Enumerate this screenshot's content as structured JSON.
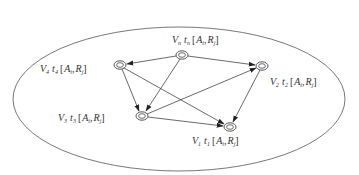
{
  "diagram": {
    "type": "directed-graph",
    "boundary": "ellipse",
    "nodes": [
      {
        "id": "Vn",
        "x": 182,
        "y": 55,
        "label": {
          "v": "V",
          "vsub": "n",
          "t": "t",
          "tsub": "n",
          "a": "A",
          "asub": "i",
          "r": "R",
          "rsub": "j"
        }
      },
      {
        "id": "V4",
        "x": 120,
        "y": 65,
        "label": {
          "v": "V",
          "vsub": "4",
          "t": "t",
          "tsub": "4",
          "a": "A",
          "asub": "i",
          "r": "R",
          "rsub": "j"
        }
      },
      {
        "id": "V2",
        "x": 262,
        "y": 66,
        "label": {
          "v": "V",
          "vsub": "2",
          "t": "t",
          "tsub": "2",
          "a": "A",
          "asub": "i",
          "r": "R",
          "rsub": "j"
        }
      },
      {
        "id": "V3",
        "x": 142,
        "y": 116,
        "label": {
          "v": "V",
          "vsub": "3",
          "t": "t",
          "tsub": "3",
          "a": "A",
          "asub": "i",
          "r": "R",
          "rsub": "j"
        }
      },
      {
        "id": "V1",
        "x": 230,
        "y": 127,
        "label": {
          "v": "V",
          "vsub": "1",
          "t": "t",
          "tsub": "1",
          "a": "A",
          "asub": "i",
          "r": "R",
          "rsub": "j"
        }
      }
    ],
    "edges": [
      {
        "from": "Vn",
        "to": "V4"
      },
      {
        "from": "Vn",
        "to": "V2"
      },
      {
        "from": "Vn",
        "to": "V3"
      },
      {
        "from": "V4",
        "to": "V3"
      },
      {
        "from": "V4",
        "to": "V1"
      },
      {
        "from": "V3",
        "to": "V2"
      },
      {
        "from": "V3",
        "to": "V1"
      },
      {
        "from": "V2",
        "to": "V1"
      }
    ]
  },
  "labels": {
    "vn": {
      "v": "V",
      "vsub": "n",
      "t": "t",
      "tsub": "n",
      "open": "[",
      "a": "A",
      "asub": "i",
      "sep": ",",
      "r": "R",
      "rsub": "j",
      "close": "]"
    },
    "v4": {
      "v": "V",
      "vsub": "4",
      "t": "t",
      "tsub": "4",
      "open": "[",
      "a": "A",
      "asub": "i",
      "sep": ",",
      "r": "R",
      "rsub": "j",
      "close": "]"
    },
    "v2": {
      "v": "V",
      "vsub": "2",
      "t": "t",
      "tsub": "2",
      "open": "[",
      "a": "A",
      "asub": "i",
      "sep": ",",
      "r": "R",
      "rsub": "j",
      "close": "]"
    },
    "v3": {
      "v": "V",
      "vsub": "3",
      "t": "t",
      "tsub": "3",
      "open": "[",
      "a": "A",
      "asub": "i",
      "sep": ",",
      "r": "R",
      "rsub": "j",
      "close": "]"
    },
    "v1": {
      "v": "V",
      "vsub": "1",
      "t": "t",
      "tsub": "1",
      "open": "[",
      "a": "A",
      "asub": "i",
      "sep": ",",
      "r": "R",
      "rsub": "j",
      "close": "]"
    }
  },
  "colors": {
    "stroke": "#444444",
    "text": "#333333",
    "background": "#ffffff"
  }
}
